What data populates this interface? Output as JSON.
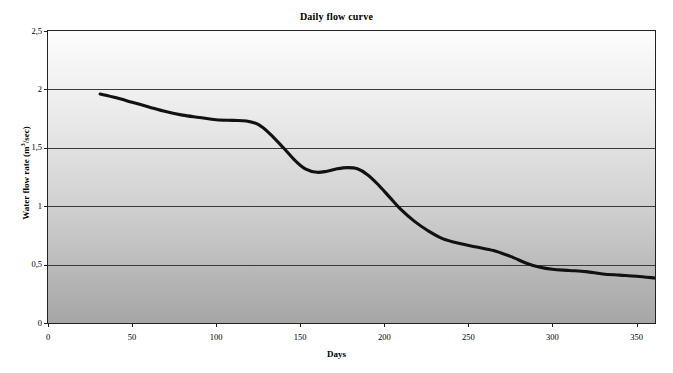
{
  "chart_data": {
    "type": "line",
    "title": "Daily flow curve",
    "xlabel": "Days",
    "ylabel": "Water flow rate (m3/sec)",
    "ylabel_parts": {
      "prefix": "Water flow rate (m",
      "superscript": "3",
      "suffix": "/sec)"
    },
    "xlim": [
      0,
      361
    ],
    "ylim": [
      0,
      2.5
    ],
    "xticks": [
      0,
      50,
      100,
      150,
      200,
      250,
      300,
      350
    ],
    "xticklabels": [
      "0",
      "50",
      "100",
      "150",
      "200",
      "250",
      "300",
      "350"
    ],
    "yticks": [
      0,
      0.5,
      1,
      1.5,
      2,
      2.5
    ],
    "yticklabels": [
      "0",
      "0,5",
      "1",
      "1,5",
      "2",
      "2,5"
    ],
    "grid": "horizontal",
    "legend": "none",
    "series": [
      {
        "name": "Daily flow",
        "x": [
          31,
          40,
          50,
          60,
          70,
          80,
          90,
          100,
          110,
          118,
          125,
          132,
          140,
          147,
          153,
          160,
          166,
          172,
          178,
          184,
          190,
          196,
          203,
          210,
          218,
          226,
          235,
          245,
          255,
          265,
          275,
          285,
          292,
          300,
          310,
          320,
          330,
          340,
          350,
          361
        ],
        "y": [
          1.96,
          1.93,
          1.89,
          1.85,
          1.81,
          1.78,
          1.76,
          1.74,
          1.735,
          1.73,
          1.7,
          1.62,
          1.5,
          1.39,
          1.32,
          1.29,
          1.3,
          1.32,
          1.33,
          1.32,
          1.27,
          1.19,
          1.08,
          0.97,
          0.87,
          0.79,
          0.72,
          0.68,
          0.65,
          0.62,
          0.57,
          0.51,
          0.48,
          0.46,
          0.45,
          0.44,
          0.42,
          0.41,
          0.4,
          0.385
        ]
      }
    ],
    "colors": {
      "curve": "#111111",
      "grid": "#3a3a3a",
      "frame": "#222222",
      "plot_bg_top": "#fdfdfd",
      "plot_bg_bottom": "#a6a6a6"
    }
  },
  "plot_geometry": {
    "left_px": 48,
    "top_px": 31,
    "width_px": 607,
    "height_px": 292
  }
}
